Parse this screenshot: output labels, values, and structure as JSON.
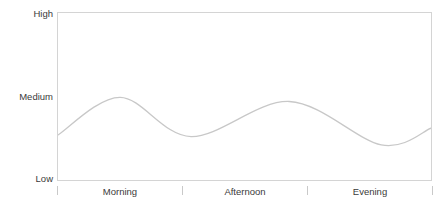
{
  "chart_data": {
    "type": "line",
    "title": "",
    "subtitle": "",
    "xlabel": "",
    "ylabel": "",
    "grid": false,
    "legend": "none",
    "y_axis": {
      "tick_labels": [
        "High",
        "Medium",
        "Low"
      ],
      "tick_values": [
        3,
        2,
        1
      ],
      "ylim": [
        1,
        3
      ],
      "order": "top-to-bottom"
    },
    "x_axis": {
      "categories": [
        "Morning",
        "Afternoon",
        "Evening"
      ],
      "tick_marks": 4,
      "xlim": [
        0,
        3
      ]
    },
    "series": [
      {
        "name": "Activity Level",
        "color": "#c8c8c8",
        "smooth": true,
        "x": [
          0.0,
          0.5,
          1.07,
          1.86,
          2.6,
          3.0
        ],
        "y": [
          1.54,
          1.99,
          1.52,
          1.94,
          1.42,
          1.62
        ],
        "point_labels": [
          "start",
          "morning peak",
          "midday dip",
          "afternoon peak",
          "evening dip",
          "end"
        ]
      }
    ],
    "annotations": []
  },
  "axis": {
    "y_labels": {
      "high": "High",
      "medium": "Medium",
      "low": "Low"
    },
    "x_labels": {
      "morning": "Morning",
      "afternoon": "Afternoon",
      "evening": "Evening"
    }
  },
  "colors": {
    "line": "#c8c8c8",
    "frame": "#d4d4d4",
    "tick": "#c9c9c9",
    "text": "#3a3a3a",
    "background": "#ffffff"
  }
}
